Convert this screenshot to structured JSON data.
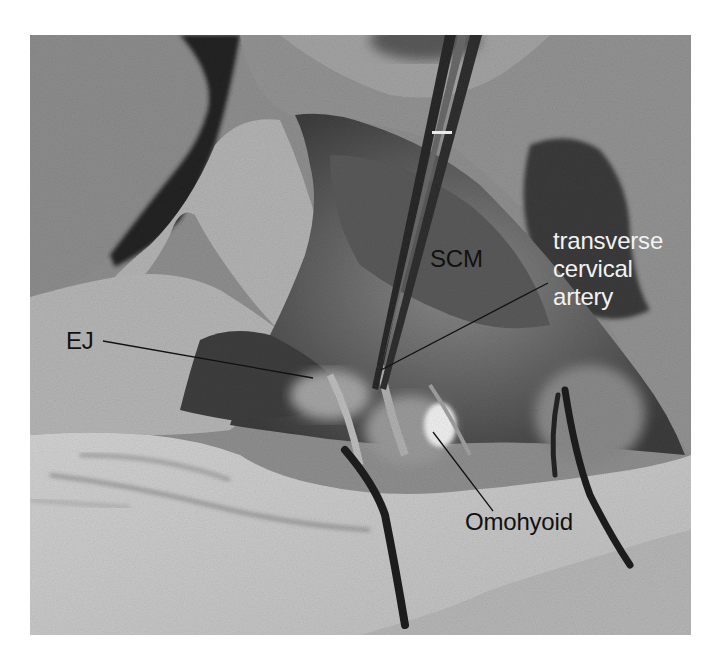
{
  "figure": {
    "type": "surgical-photograph",
    "color_mode": "grayscale"
  },
  "labels": {
    "scm": "SCM",
    "ej": "EJ",
    "omohyoid": "Omohyoid",
    "transverse_cervical_artery": [
      "transverse",
      "cervical",
      "artery"
    ]
  },
  "colors": {
    "label_dark": "#111111",
    "label_light": "#f2f2f2",
    "leader_line": "#111111"
  }
}
